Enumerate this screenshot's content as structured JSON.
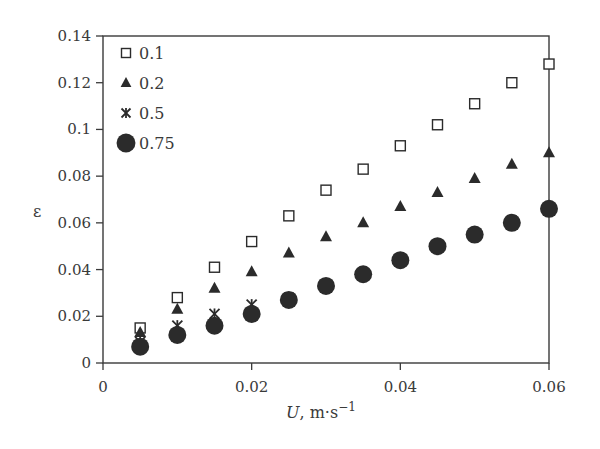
{
  "chart_data": {
    "type": "scatter",
    "title": "",
    "xlabel": "U, m·s⁻¹",
    "xlabel_italic": "U",
    "xlabel_unit": ", m·s",
    "xlabel_sup": "−1",
    "ylabel": "ε",
    "xlim": [
      0,
      0.06
    ],
    "ylim": [
      0,
      0.14
    ],
    "xticks": [
      0,
      0.02,
      0.04,
      0.06
    ],
    "xtick_labels": [
      "0",
      "0.02",
      "0.04",
      "0.06"
    ],
    "yticks": [
      0,
      0.02,
      0.04,
      0.06,
      0.08,
      0.1,
      0.12,
      0.14
    ],
    "ytick_labels": [
      "0",
      "0.02",
      "0.04",
      "0.06",
      "0.08",
      "0.1",
      "0.12",
      "0.14"
    ],
    "grid": false,
    "legend_position": "upper left",
    "x": [
      0.005,
      0.01,
      0.015,
      0.02,
      0.025,
      0.03,
      0.035,
      0.04,
      0.045,
      0.05,
      0.055,
      0.06
    ],
    "series": [
      {
        "name": "0.1",
        "marker": "open-square",
        "values": [
          0.015,
          0.028,
          0.041,
          0.052,
          0.063,
          0.074,
          0.083,
          0.093,
          0.102,
          0.111,
          0.12,
          0.128
        ]
      },
      {
        "name": "0.2",
        "marker": "filled-triangle",
        "values": [
          0.013,
          0.023,
          0.032,
          0.039,
          0.047,
          0.054,
          0.06,
          0.067,
          0.073,
          0.079,
          0.085,
          0.09
        ]
      },
      {
        "name": "0.5",
        "marker": "asterisk",
        "values": [
          0.009,
          0.016,
          0.021,
          0.025,
          0.028,
          0.033,
          0.038,
          0.044,
          0.05,
          0.055,
          0.061,
          0.066
        ]
      },
      {
        "name": "0.75",
        "marker": "filled-circle",
        "values": [
          0.007,
          0.012,
          0.016,
          0.021,
          0.027,
          0.033,
          0.038,
          0.044,
          0.05,
          0.055,
          0.06,
          0.066
        ]
      }
    ]
  },
  "colors": {
    "axis": "#3a3a3a",
    "marker": "#2b2b2b",
    "background": "#ffffff"
  }
}
